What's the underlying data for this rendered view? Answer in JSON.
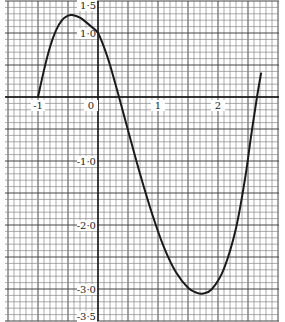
{
  "chart_data": {
    "type": "line",
    "title": "",
    "xlabel": "",
    "ylabel": "",
    "xlim": [
      -1.55,
      3.02
    ],
    "ylim": [
      -3.5,
      1.5
    ],
    "grid": true,
    "x_ticks": [
      {
        "value": -1,
        "label": "-1"
      },
      {
        "value": 0,
        "label": "0"
      },
      {
        "value": 1,
        "label": "1"
      },
      {
        "value": 2,
        "label": "2"
      }
    ],
    "y_ticks": [
      {
        "value": 1.5,
        "label": "1·5"
      },
      {
        "value": 1.0,
        "label": "1·0"
      },
      {
        "value": -1.0,
        "label": "-1·0"
      },
      {
        "value": -2.0,
        "label": "-2·0"
      },
      {
        "value": -3.0,
        "label": "-3·0"
      },
      {
        "value": -3.5,
        "label": "-3·5"
      }
    ],
    "series": [
      {
        "name": "curve",
        "color": "#1a1a1a",
        "points": [
          [
            -1.0,
            0.0
          ],
          [
            -0.9,
            0.42
          ],
          [
            -0.8,
            0.78
          ],
          [
            -0.7,
            1.04
          ],
          [
            -0.6,
            1.2
          ],
          [
            -0.5,
            1.27
          ],
          [
            -0.43,
            1.28
          ],
          [
            -0.3,
            1.24
          ],
          [
            -0.2,
            1.17
          ],
          [
            -0.1,
            1.09
          ],
          [
            0.0,
            1.0
          ],
          [
            0.1,
            0.78
          ],
          [
            0.2,
            0.5
          ],
          [
            0.35,
            0.0
          ],
          [
            0.5,
            -0.52
          ],
          [
            0.7,
            -1.2
          ],
          [
            0.9,
            -1.82
          ],
          [
            1.1,
            -2.35
          ],
          [
            1.3,
            -2.74
          ],
          [
            1.5,
            -2.98
          ],
          [
            1.65,
            -3.06
          ],
          [
            1.75,
            -3.07
          ],
          [
            1.9,
            -3.0
          ],
          [
            2.1,
            -2.68
          ],
          [
            2.3,
            -2.05
          ],
          [
            2.45,
            -1.28
          ],
          [
            2.55,
            -0.62
          ],
          [
            2.65,
            0.0
          ],
          [
            2.72,
            0.38
          ]
        ]
      }
    ]
  }
}
